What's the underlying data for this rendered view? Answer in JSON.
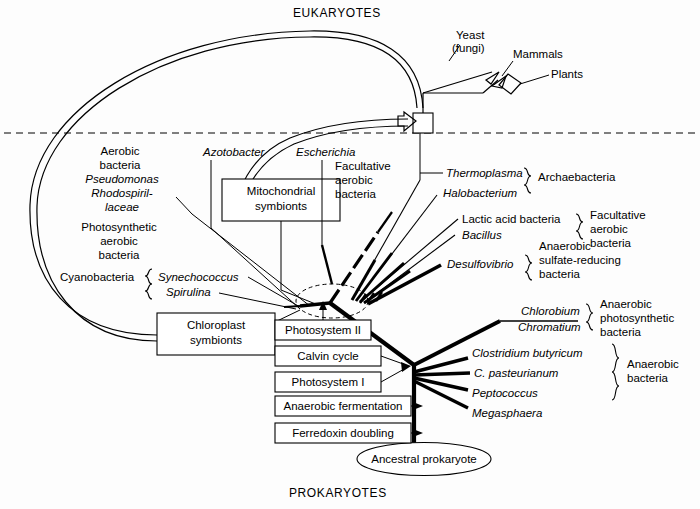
{
  "figure": {
    "top_label": "EUKARYOTES",
    "bottom_label": "PROKARYOTES"
  },
  "eukaryote_tips": {
    "yeast_line1": "Yeast",
    "yeast_line2": "(fungi)",
    "mammals": "Mammals",
    "plants": "Plants"
  },
  "left_labels": {
    "aerobic_1": "Aerobic",
    "aerobic_2": "bacteria",
    "pseudomonas": "Pseudomonas",
    "rhodospiril_1": "Rhodospiril-",
    "rhodospiril_2": "laceae",
    "photo_1": "Photosynthetic",
    "photo_2": "aerobic",
    "photo_3": "bacteria",
    "cyanobacteria": "Cyanobacteria",
    "synechococcus": "Synechococcus",
    "spirulina": "Spirulina"
  },
  "mid_labels": {
    "azotobacter": "Azotobacter",
    "escherichia": "Escherichia",
    "facultative_1": "Facultative",
    "facultative_2": "aerobic",
    "facultative_3": "bacteria"
  },
  "symbiont_boxes": [
    {
      "line1": "Mitochondrial",
      "line2": "symbionts"
    },
    {
      "line1": "Chloroplast",
      "line2": "symbionts"
    }
  ],
  "trait_boxes": [
    {
      "label": "Photosystem II"
    },
    {
      "label": "Calvin cycle"
    },
    {
      "label": "Photosystem I"
    },
    {
      "label": "Anaerobic fermentation"
    },
    {
      "label": "Ferredoxin doubling"
    }
  ],
  "root": {
    "label": "Ancestral prokaryote"
  },
  "right_groups": [
    {
      "taxa": [
        "Thermoplasma",
        "Halobacterium"
      ],
      "group_lines": [
        "Archaebacteria"
      ]
    },
    {
      "taxa": [
        "Lactic acid bacteria",
        "Bacillus"
      ],
      "group_lines": [
        "Facultative",
        "aerobic",
        "bacteria"
      ]
    },
    {
      "taxa": [
        "Desulfovibrio"
      ],
      "group_lines": [
        "Anaerobic",
        "sulfate-reducing",
        "bacteria"
      ]
    },
    {
      "taxa": [
        "Chlorobium",
        "Chromatium"
      ],
      "group_lines": [
        "Anaerobic",
        "photosynthetic",
        "bacteria"
      ]
    },
    {
      "taxa": [
        "Clostridium butyricum",
        "C. pasteurianum",
        "Peptococcus",
        "Megasphaera"
      ],
      "group_lines": [
        "Anaerobic",
        "bacteria"
      ]
    }
  ],
  "colors": {
    "ink": "#000000",
    "paper": "#fdfdfd"
  }
}
